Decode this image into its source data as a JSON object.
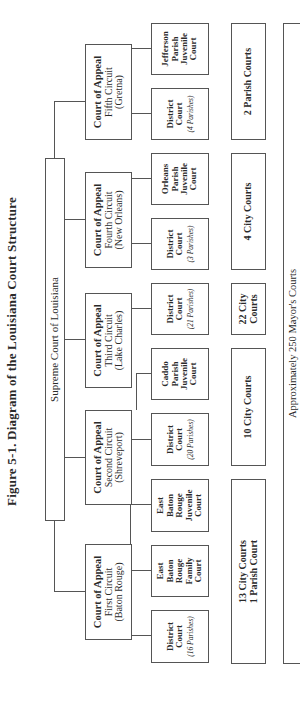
{
  "figure": {
    "title": "Figure 5-1.  Diagram of the Louisiana Court Structure"
  },
  "supreme_court": {
    "label": "Supreme Court of Louisiana"
  },
  "courts_of_appeal": [
    {
      "line1": "Court of Appeal",
      "line2": "First Circuit",
      "line3": "(Baton Rouge)"
    },
    {
      "line1": "Court of Appeal",
      "line2": "Second Circuit",
      "line3": "(Shreveport)"
    },
    {
      "line1": "Court of Appeal",
      "line2": "Third Circuit",
      "line3": "(Lake Charles)"
    },
    {
      "line1": "Court of Appeal",
      "line2": "Fourth Circuit",
      "line3": "(New Orleans)"
    },
    {
      "line1": "Court of Appeal",
      "line2": "Fifth Circuit",
      "line3": "(Gretna)"
    }
  ],
  "district_level": [
    {
      "lines": [
        "District",
        "Court"
      ],
      "sub": "(16 Parishes)"
    },
    {
      "lines": [
        "East",
        "Baton",
        "Rouge",
        "Family",
        "Court"
      ],
      "sub": ""
    },
    {
      "lines": [
        "East",
        "Baton",
        "Rouge",
        "Juvenile",
        "Court"
      ],
      "sub": ""
    },
    {
      "lines": [
        "District",
        "Court"
      ],
      "sub": "(20 Parishes)"
    },
    {
      "lines": [
        "Caddo",
        "Parish",
        "Juvenile",
        "Court"
      ],
      "sub": ""
    },
    {
      "lines": [
        "District",
        "Court"
      ],
      "sub": "(21 Parishes)"
    },
    {
      "lines": [
        "District",
        "Court"
      ],
      "sub": "(3 Parishes)"
    },
    {
      "lines": [
        "Orleans",
        "Parish",
        "Juvenile",
        "Court"
      ],
      "sub": ""
    },
    {
      "lines": [
        "District",
        "Court"
      ],
      "sub": "(4 Parishes)"
    },
    {
      "lines": [
        "Jefferson",
        "Parish",
        "Juvenile",
        "Court"
      ],
      "sub": ""
    }
  ],
  "lower_courts": [
    {
      "lines": [
        "13 City Courts",
        "1 Parish Court"
      ]
    },
    {
      "lines": [
        "10 City Courts"
      ]
    },
    {
      "lines": [
        "22 City",
        "Courts"
      ]
    },
    {
      "lines": [
        "4 City Courts"
      ]
    },
    {
      "lines": [
        "2 Parish Courts"
      ]
    }
  ],
  "mayors_courts": {
    "label": "Approximately 250 Mayor's Courts"
  },
  "colors": {
    "line": "#555555",
    "text": "#2a2a2a",
    "background": "#ffffff"
  }
}
